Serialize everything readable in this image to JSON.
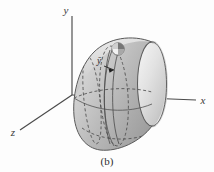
{
  "figure": {
    "caption": "(b)",
    "axes": {
      "y_label": "y",
      "x_label": "x",
      "z_label": "z"
    },
    "annotations": {
      "centroid_label": "ȳ"
    },
    "colors": {
      "background": "#fdfdfd",
      "surface_light": "#e8e8e8",
      "surface_mid": "#c2c2c2",
      "surface_dark": "#9b9b9b",
      "rim_face": "#d9d9d9",
      "outline": "#5a5a5a",
      "axis": "#4a4a4a",
      "text": "#2e2e2e",
      "element_dark": "#6f6f6f"
    }
  }
}
